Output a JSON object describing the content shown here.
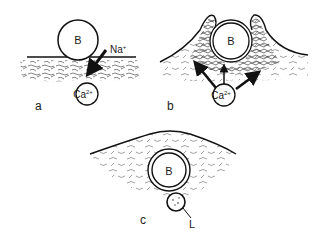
{
  "figure": {
    "panels": [
      {
        "id": "a",
        "label": "a",
        "bead_label": "B",
        "ion_label": "Na",
        "ion_charge": "+",
        "calcium_label": "Ca",
        "calcium_charge": "2+"
      },
      {
        "id": "b",
        "label": "b",
        "bead_label": "B",
        "calcium_label": "Ca",
        "calcium_charge": "2+"
      },
      {
        "id": "c",
        "label": "c",
        "bead_label": "B",
        "small_body_label": "L"
      }
    ],
    "colors": {
      "ink": "#1a1a1a",
      "background": "#ffffff"
    }
  }
}
